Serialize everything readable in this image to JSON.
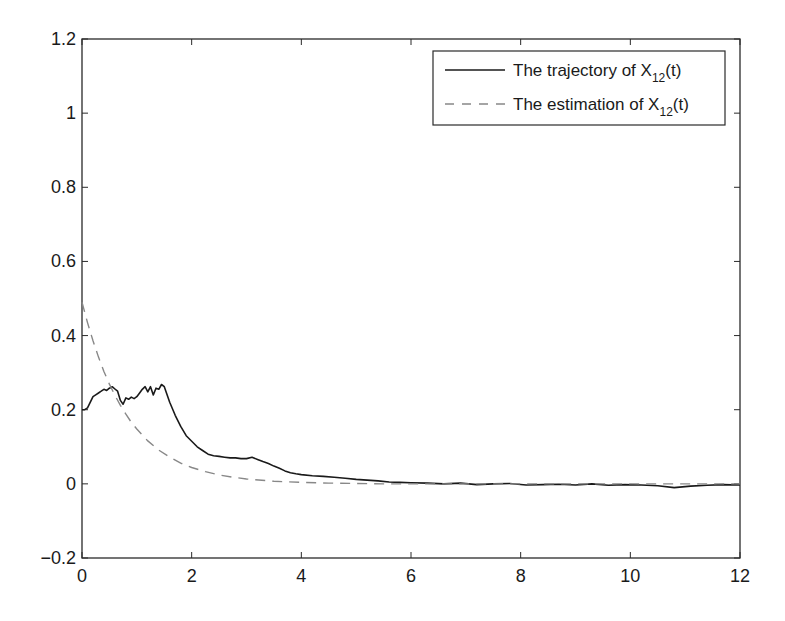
{
  "chart_data": {
    "type": "line",
    "title": "",
    "xlabel": "",
    "ylabel": "",
    "xlim": [
      0,
      12
    ],
    "ylim": [
      -0.2,
      1.2
    ],
    "grid": false,
    "legend_position": "upper right",
    "x_ticks": [
      "0",
      "2",
      "4",
      "6",
      "8",
      "10",
      "12"
    ],
    "x_tick_values": [
      0,
      2,
      4,
      6,
      8,
      10,
      12
    ],
    "y_ticks": [
      "-0.2",
      "0",
      "0.2",
      "0.4",
      "0.6",
      "0.8",
      "1",
      "1.2"
    ],
    "y_tick_values": [
      -0.2,
      0,
      0.2,
      0.4,
      0.6,
      0.8,
      1.0,
      1.2
    ],
    "legend": [
      {
        "label_main": "The trajectory of X",
        "label_sub": "12",
        "label_tail": "(t)",
        "style": "solid",
        "color": "#1a1a1a"
      },
      {
        "label_main": "The estimation of X",
        "label_sub": "12",
        "label_tail": "(t)",
        "style": "dashed",
        "color": "#888888"
      }
    ],
    "series": [
      {
        "name": "The trajectory of X12(t)",
        "style": "solid",
        "color": "#1a1a1a",
        "x": [
          0,
          0.05,
          0.1,
          0.15,
          0.2,
          0.25,
          0.3,
          0.35,
          0.4,
          0.45,
          0.5,
          0.55,
          0.6,
          0.65,
          0.7,
          0.75,
          0.8,
          0.85,
          0.9,
          0.95,
          1.0,
          1.05,
          1.1,
          1.15,
          1.2,
          1.25,
          1.3,
          1.35,
          1.4,
          1.45,
          1.5,
          1.6,
          1.7,
          1.8,
          1.9,
          2.0,
          2.1,
          2.2,
          2.3,
          2.4,
          2.5,
          2.6,
          2.7,
          2.8,
          2.9,
          3.0,
          3.1,
          3.2,
          3.3,
          3.4,
          3.5,
          3.6,
          3.7,
          3.8,
          3.9,
          4.0,
          4.2,
          4.4,
          4.6,
          4.8,
          5.0,
          5.2,
          5.4,
          5.6,
          5.8,
          6.0,
          6.3,
          6.6,
          6.9,
          7.2,
          7.5,
          7.8,
          8.1,
          8.4,
          8.7,
          9.0,
          9.3,
          9.6,
          9.9,
          10.2,
          10.5,
          10.8,
          11.1,
          11.4,
          11.7,
          12.0
        ],
        "y": [
          0.2,
          0.2,
          0.205,
          0.22,
          0.235,
          0.24,
          0.245,
          0.25,
          0.255,
          0.252,
          0.258,
          0.262,
          0.256,
          0.25,
          0.225,
          0.215,
          0.232,
          0.228,
          0.234,
          0.23,
          0.235,
          0.245,
          0.255,
          0.262,
          0.248,
          0.262,
          0.24,
          0.258,
          0.255,
          0.268,
          0.262,
          0.22,
          0.185,
          0.155,
          0.13,
          0.115,
          0.1,
          0.09,
          0.08,
          0.076,
          0.074,
          0.072,
          0.07,
          0.07,
          0.068,
          0.068,
          0.072,
          0.066,
          0.06,
          0.055,
          0.048,
          0.042,
          0.035,
          0.03,
          0.027,
          0.025,
          0.022,
          0.02,
          0.018,
          0.015,
          0.012,
          0.01,
          0.008,
          0.005,
          0.004,
          0.003,
          0.002,
          0.0,
          0.002,
          -0.002,
          0.0,
          0.001,
          -0.003,
          -0.002,
          -0.001,
          -0.003,
          0.0,
          -0.004,
          -0.002,
          -0.003,
          -0.005,
          -0.01,
          -0.006,
          -0.004,
          -0.002,
          -0.003
        ]
      },
      {
        "name": "The estimation of X12(t)",
        "style": "dashed",
        "color": "#888888",
        "x": [
          0,
          0.1,
          0.2,
          0.3,
          0.4,
          0.5,
          0.6,
          0.7,
          0.8,
          0.9,
          1.0,
          1.2,
          1.4,
          1.6,
          1.8,
          2.0,
          2.25,
          2.5,
          2.75,
          3.0,
          3.5,
          4.0,
          4.5,
          5.0,
          5.5,
          6.0,
          7.0,
          8.0,
          9.0,
          10.0,
          11.0,
          12.0
        ],
        "y": [
          0.49,
          0.435,
          0.386,
          0.342,
          0.303,
          0.269,
          0.239,
          0.212,
          0.188,
          0.166,
          0.148,
          0.116,
          0.091,
          0.072,
          0.056,
          0.044,
          0.033,
          0.024,
          0.018,
          0.013,
          0.007,
          0.004,
          0.002,
          0.001,
          0.0,
          0.0,
          0.0,
          0.0,
          0.0,
          0.0,
          0.0,
          0.0
        ]
      }
    ]
  },
  "plot_area": {
    "left": 82,
    "top": 39,
    "right": 740,
    "bottom": 558
  }
}
